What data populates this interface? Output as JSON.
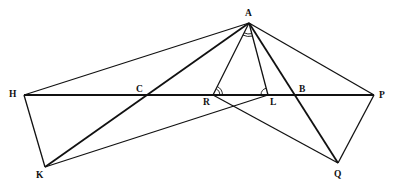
{
  "diagram": {
    "type": "geometric-construction",
    "points": {
      "A": {
        "label": "A",
        "x": 249,
        "y": 23,
        "lx": 245,
        "ly": 16
      },
      "H": {
        "label": "H",
        "x": 24,
        "y": 95,
        "lx": 9,
        "ly": 97
      },
      "C": {
        "label": "C",
        "x": 148,
        "y": 95,
        "lx": 136,
        "ly": 92
      },
      "R": {
        "label": "R",
        "x": 213,
        "y": 95,
        "lx": 203,
        "ly": 105
      },
      "L": {
        "label": "L",
        "x": 268,
        "y": 95,
        "lx": 270,
        "ly": 105
      },
      "B": {
        "label": "B",
        "x": 295,
        "y": 95,
        "lx": 299,
        "ly": 92
      },
      "P": {
        "label": "P",
        "x": 374,
        "y": 95,
        "lx": 379,
        "ly": 98
      },
      "K": {
        "label": "K",
        "x": 45,
        "y": 167,
        "lx": 36,
        "ly": 178
      },
      "Q": {
        "label": "Q",
        "x": 338,
        "y": 163,
        "lx": 334,
        "ly": 177
      }
    },
    "segments": [
      {
        "from": "A",
        "to": "H",
        "weight": "normal"
      },
      {
        "from": "A",
        "to": "P",
        "weight": "normal"
      },
      {
        "from": "A",
        "to": "K",
        "weight": "thick",
        "through": "C"
      },
      {
        "from": "A",
        "to": "Q",
        "weight": "thick",
        "through": "B"
      },
      {
        "from": "A",
        "to": "R",
        "weight": "normal"
      },
      {
        "from": "A",
        "to": "L",
        "weight": "normal"
      },
      {
        "from": "H",
        "to": "P",
        "weight": "thick"
      },
      {
        "from": "H",
        "to": "K",
        "weight": "normal"
      },
      {
        "from": "P",
        "to": "Q",
        "weight": "normal"
      },
      {
        "from": "K",
        "to": "L",
        "weight": "normal"
      },
      {
        "from": "R",
        "to": "Q",
        "weight": "normal"
      }
    ],
    "angle_marks": [
      {
        "vertex": "A",
        "between": [
          "R",
          "L"
        ],
        "arcs": 2
      },
      {
        "vertex": "R",
        "between": [
          "A",
          "L"
        ],
        "arcs": 2
      },
      {
        "vertex": "L",
        "between": [
          "A",
          "R"
        ],
        "arcs": 1
      }
    ]
  }
}
